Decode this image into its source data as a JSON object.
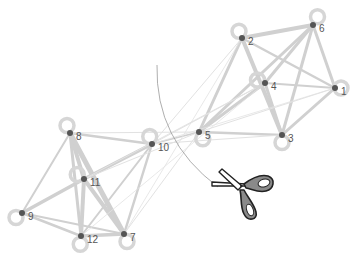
{
  "diagram": {
    "type": "graph-cut-illustration",
    "colors": {
      "edge": "#d0d0d0",
      "edge_light": "#e2e2e2",
      "node": "#555555",
      "loop": "#d6d6d6",
      "label": "#555555",
      "cut_arc": "#999999",
      "scissors_handle": "#8a8a8a"
    },
    "nodes": [
      {
        "id": "1",
        "label": "1",
        "x": 335,
        "y": 88,
        "loop": {
          "dx": 8,
          "dy": 0
        }
      },
      {
        "id": "2",
        "label": "2",
        "x": 242,
        "y": 38,
        "loop": {
          "dx": -4,
          "dy": -9
        }
      },
      {
        "id": "3",
        "label": "3",
        "x": 282,
        "y": 135,
        "loop": {
          "dx": 0,
          "dy": 10
        }
      },
      {
        "id": "4",
        "label": "4",
        "x": 265,
        "y": 83,
        "loop": {
          "dx": -10,
          "dy": -4
        }
      },
      {
        "id": "5",
        "label": "5",
        "x": 199,
        "y": 132,
        "loop": {
          "dx": 5,
          "dy": 9
        }
      },
      {
        "id": "6",
        "label": "6",
        "x": 313,
        "y": 25,
        "loop": {
          "dx": 6,
          "dy": -11
        }
      },
      {
        "id": "7",
        "label": "7",
        "x": 124,
        "y": 234,
        "loop": {
          "dx": 4,
          "dy": 10
        }
      },
      {
        "id": "8",
        "label": "8",
        "x": 70,
        "y": 133,
        "loop": {
          "dx": -4,
          "dy": -10
        }
      },
      {
        "id": "9",
        "label": "9",
        "x": 22,
        "y": 213,
        "loop": {
          "dx": -8,
          "dy": 6
        }
      },
      {
        "id": "10",
        "label": "10",
        "x": 152,
        "y": 144,
        "loop": {
          "dx": -3,
          "dy": -10
        }
      },
      {
        "id": "11",
        "label": "11",
        "x": 84,
        "y": 179,
        "loop": {
          "dx": -9,
          "dy": -6
        }
      },
      {
        "id": "12",
        "label": "12",
        "x": 81,
        "y": 236,
        "loop": {
          "dx": -1,
          "dy": 11
        }
      }
    ],
    "edges": [
      {
        "s": "2",
        "t": "6",
        "w": 4
      },
      {
        "s": "2",
        "t": "3",
        "w": 4
      },
      {
        "s": "2",
        "t": "1",
        "w": 2.5
      },
      {
        "s": "2",
        "t": "5",
        "w": 3
      },
      {
        "s": "6",
        "t": "4",
        "w": 3
      },
      {
        "s": "6",
        "t": "3",
        "w": 3
      },
      {
        "s": "6",
        "t": "1",
        "w": 3
      },
      {
        "s": "6",
        "t": "5",
        "w": 3
      },
      {
        "s": "4",
        "t": "1",
        "w": 2
      },
      {
        "s": "4",
        "t": "3",
        "w": 3
      },
      {
        "s": "4",
        "t": "5",
        "w": 3
      },
      {
        "s": "1",
        "t": "3",
        "w": 3
      },
      {
        "s": "1",
        "t": "5",
        "w": 1
      },
      {
        "s": "5",
        "t": "3",
        "w": 2.5
      },
      {
        "s": "8",
        "t": "10",
        "w": 2.5
      },
      {
        "s": "8",
        "t": "11",
        "w": 4
      },
      {
        "s": "8",
        "t": "12",
        "w": 3
      },
      {
        "s": "8",
        "t": "7",
        "w": 5
      },
      {
        "s": "8",
        "t": "9",
        "w": 2
      },
      {
        "s": "10",
        "t": "11",
        "w": 3.5
      },
      {
        "s": "10",
        "t": "12",
        "w": 2
      },
      {
        "s": "10",
        "t": "7",
        "w": 2.5
      },
      {
        "s": "11",
        "t": "9",
        "w": 3.5
      },
      {
        "s": "11",
        "t": "12",
        "w": 4
      },
      {
        "s": "11",
        "t": "7",
        "w": 4
      },
      {
        "s": "9",
        "t": "12",
        "w": 2.5
      },
      {
        "s": "9",
        "t": "7",
        "w": 2
      },
      {
        "s": "12",
        "t": "7",
        "w": 3.5
      },
      {
        "s": "8",
        "t": "5",
        "w": 1
      },
      {
        "s": "10",
        "t": "5",
        "w": 1.5
      },
      {
        "s": "10",
        "t": "2",
        "w": 1
      },
      {
        "s": "10",
        "t": "4",
        "w": 1
      },
      {
        "s": "11",
        "t": "4",
        "w": 1
      },
      {
        "s": "11",
        "t": "5",
        "w": 1
      },
      {
        "s": "7",
        "t": "5",
        "w": 1
      },
      {
        "s": "7",
        "t": "2",
        "w": 0.8
      },
      {
        "s": "12",
        "t": "4",
        "w": 0.8
      },
      {
        "s": "10",
        "t": "3",
        "w": 1
      },
      {
        "s": "10",
        "t": "1",
        "w": 0.8
      }
    ],
    "cut_arc": {
      "x1": 157,
      "y1": 65,
      "cx": 155,
      "cy": 140,
      "x2": 218,
      "y2": 187
    },
    "scissors": {
      "x": 210,
      "y": 172,
      "icon": "scissors-icon"
    }
  }
}
